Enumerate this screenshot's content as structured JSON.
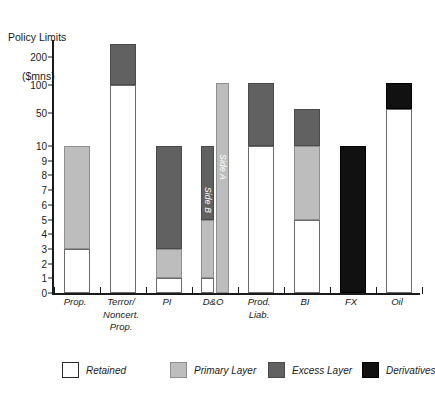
{
  "chart_data": {
    "type": "bar",
    "title": "Policy Limits ($mns)",
    "title_line1": "Policy Limits",
    "title_line2": "($mns)",
    "xlabel": "",
    "ylabel": "Policy Limits ($mns)",
    "grid": false,
    "legend_position": "bottom",
    "stacked": true,
    "y_axis": {
      "scale": "piecewise-linear-then-log",
      "ylim": [
        0,
        300
      ],
      "tick_labels": [
        "0",
        "1",
        "2",
        "3",
        "4",
        "5",
        "6",
        "7",
        "8",
        "9",
        "10",
        "50",
        "100",
        "200"
      ],
      "tick_values": [
        0,
        1,
        2,
        3,
        4,
        5,
        6,
        7,
        8,
        9,
        10,
        50,
        100,
        200
      ]
    },
    "categories": [
      "Prop.",
      "Terror/ Noncert. Prop.",
      "PI",
      "D&O",
      "Prod. Liab.",
      "BI",
      "FX",
      "Oil"
    ],
    "series": [
      {
        "name": "Retained",
        "color": "#ffffff"
      },
      {
        "name": "Primary Layer",
        "color": "#bdbdbd"
      },
      {
        "name": "Excess Layer",
        "color": "#616161"
      },
      {
        "name": "Derivatives",
        "color": "#111111"
      }
    ],
    "bars": [
      {
        "category": "Prop.",
        "label_lines": [
          "Prop."
        ],
        "subbars": [
          {
            "name": "",
            "segments": [
              {
                "layer": "Retained",
                "from": 0,
                "to": 3
              },
              {
                "layer": "Primary Layer",
                "from": 3,
                "to": 10
              }
            ]
          }
        ]
      },
      {
        "category": "Terror/ Noncert. Prop.",
        "label_lines": [
          "Terror/",
          "Noncert.",
          "Prop."
        ],
        "subbars": [
          {
            "name": "",
            "segments": [
              {
                "layer": "Retained",
                "from": 0,
                "to": 100
              },
              {
                "layer": "Excess Layer",
                "from": 100,
                "to": 275
              }
            ]
          }
        ]
      },
      {
        "category": "PI",
        "label_lines": [
          "PI"
        ],
        "subbars": [
          {
            "name": "",
            "segments": [
              {
                "layer": "Retained",
                "from": 0,
                "to": 1
              },
              {
                "layer": "Primary Layer",
                "from": 1,
                "to": 3
              },
              {
                "layer": "Excess Layer",
                "from": 3,
                "to": 10
              }
            ]
          }
        ]
      },
      {
        "category": "D&O",
        "label_lines": [
          "D&O"
        ],
        "subbars": [
          {
            "name": "Side B",
            "segments": [
              {
                "layer": "Retained",
                "from": 0,
                "to": 1
              },
              {
                "layer": "Primary Layer",
                "from": 1,
                "to": 5
              },
              {
                "layer": "Excess Layer",
                "from": 5,
                "to": 10
              }
            ]
          },
          {
            "name": "Side A",
            "segments": [
              {
                "layer": "Primary Layer",
                "from": 0,
                "to": 105
              }
            ]
          }
        ]
      },
      {
        "category": "Prod. Liab.",
        "label_lines": [
          "Prod.",
          "Liab."
        ],
        "subbars": [
          {
            "name": "",
            "segments": [
              {
                "layer": "Retained",
                "from": 0,
                "to": 10
              },
              {
                "layer": "Excess Layer",
                "from": 10,
                "to": 105
              }
            ]
          }
        ]
      },
      {
        "category": "BI",
        "label_lines": [
          "BI"
        ],
        "subbars": [
          {
            "name": "",
            "segments": [
              {
                "layer": "Retained",
                "from": 0,
                "to": 5
              },
              {
                "layer": "Primary Layer",
                "from": 5,
                "to": 10
              },
              {
                "layer": "Excess Layer",
                "from": 10,
                "to": 55
              }
            ]
          }
        ]
      },
      {
        "category": "FX",
        "label_lines": [
          "FX"
        ],
        "subbars": [
          {
            "name": "",
            "segments": [
              {
                "layer": "Derivatives",
                "from": 0,
                "to": 10
              }
            ]
          }
        ]
      },
      {
        "category": "Oil",
        "label_lines": [
          "Oil"
        ],
        "subbars": [
          {
            "name": "",
            "segments": [
              {
                "layer": "Retained",
                "from": 0,
                "to": 55
              },
              {
                "layer": "Derivatives",
                "from": 55,
                "to": 105
              }
            ]
          }
        ]
      }
    ]
  },
  "legend": {
    "items": [
      {
        "label": "Retained",
        "key": "retained"
      },
      {
        "label": "Primary Layer",
        "key": "primary"
      },
      {
        "label": "Excess Layer",
        "key": "excess"
      },
      {
        "label": "Derivatives",
        "key": "derivatives"
      }
    ]
  }
}
